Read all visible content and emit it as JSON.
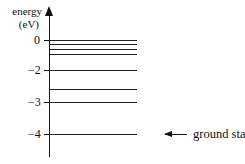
{
  "diagram": {
    "type": "energy-level-diagram",
    "axis": {
      "title_line1": "energy",
      "title_line2": "(eV)",
      "ticks": [
        {
          "label": "0",
          "value": 0
        },
        {
          "label": "−2",
          "value": -2
        },
        {
          "label": "−3",
          "value": -3
        },
        {
          "label": "−4",
          "value": -4
        }
      ]
    },
    "levels": [
      {
        "energy_ev": 0.0
      },
      {
        "energy_ev": -0.2
      },
      {
        "energy_ev": -0.45
      },
      {
        "energy_ev": -0.7
      },
      {
        "energy_ev": -2.0
      },
      {
        "energy_ev": -2.6
      },
      {
        "energy_ev": -3.0
      },
      {
        "energy_ev": -4.0,
        "annotation": "ground state"
      }
    ],
    "annotation": {
      "label": "ground state",
      "icon": "left-arrow-icon"
    }
  }
}
